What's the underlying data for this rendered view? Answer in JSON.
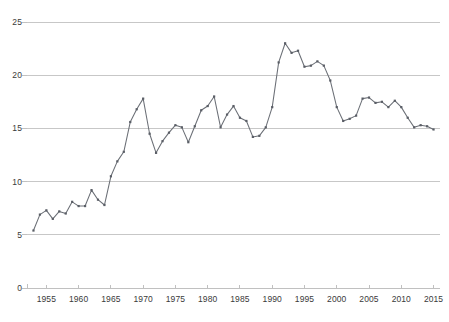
{
  "chart_data": {
    "type": "line",
    "title": "",
    "subtitle": "",
    "xlabel": "",
    "ylabel": "",
    "xlim": [
      1952,
      2016
    ],
    "ylim": [
      0,
      25
    ],
    "grid": true,
    "legend": false,
    "legend_position": "none",
    "line_color": "#6b6f76",
    "marker_color": "#5a5e66",
    "grid_color": "#b9b9b9",
    "axis_color": "#b9b9b9",
    "text_color": "#3a3a3a",
    "y_ticks": [
      0,
      5,
      10,
      15,
      20,
      25
    ],
    "y_tick_labels": [
      "0",
      "5",
      "10",
      "15",
      "20",
      "25"
    ],
    "x_ticks": [
      1955,
      1960,
      1965,
      1970,
      1975,
      1980,
      1985,
      1990,
      1995,
      2000,
      2005,
      2010,
      2015
    ],
    "x_tick_labels": [
      "1955",
      "1960",
      "1965",
      "1970",
      "1975",
      "1980",
      "1985",
      "1990",
      "1995",
      "2000",
      "2005",
      "2010",
      "2015"
    ],
    "x": [
      1953,
      1954,
      1955,
      1956,
      1957,
      1958,
      1959,
      1960,
      1961,
      1962,
      1963,
      1964,
      1965,
      1966,
      1967,
      1968,
      1969,
      1970,
      1971,
      1972,
      1973,
      1974,
      1975,
      1976,
      1977,
      1978,
      1979,
      1980,
      1981,
      1982,
      1983,
      1984,
      1985,
      1986,
      1987,
      1988,
      1989,
      1990,
      1991,
      1992,
      1993,
      1994,
      1995,
      1996,
      1997,
      1998,
      1999,
      2000,
      2001,
      2002,
      2003,
      2004,
      2005,
      2006,
      2007,
      2008,
      2009,
      2010,
      2011,
      2012,
      2013,
      2014,
      2015
    ],
    "values": [
      5.4,
      6.9,
      7.3,
      6.5,
      7.2,
      7.0,
      8.1,
      7.7,
      7.7,
      9.2,
      8.3,
      7.8,
      10.5,
      11.9,
      12.8,
      15.6,
      16.8,
      17.8,
      14.5,
      12.7,
      13.8,
      14.6,
      15.3,
      15.1,
      13.7,
      15.2,
      16.7,
      17.1,
      18.0,
      15.1,
      16.3,
      17.1,
      16.0,
      15.7,
      14.2,
      14.3,
      15.1,
      17.0,
      21.2,
      23.0,
      22.1,
      22.3,
      20.8,
      20.9,
      21.3,
      20.9,
      19.5,
      17.0,
      15.7,
      15.9,
      16.2,
      17.8,
      17.9,
      17.4,
      17.5,
      17.0,
      17.6,
      17.0,
      16.0,
      15.1,
      15.3,
      15.2,
      14.9
    ],
    "series": [
      {
        "name": "series-1",
        "values": [
          5.4,
          6.9,
          7.3,
          6.5,
          7.2,
          7.0,
          8.1,
          7.7,
          7.7,
          9.2,
          8.3,
          7.8,
          10.5,
          11.9,
          12.8,
          15.6,
          16.8,
          17.8,
          14.5,
          12.7,
          13.8,
          14.6,
          15.3,
          15.1,
          13.7,
          15.2,
          16.7,
          17.1,
          18.0,
          15.1,
          16.3,
          17.1,
          16.0,
          15.7,
          14.2,
          14.3,
          15.1,
          17.0,
          21.2,
          23.0,
          22.1,
          22.3,
          20.8,
          20.9,
          21.3,
          20.9,
          19.5,
          17.0,
          15.7,
          15.9,
          16.2,
          17.8,
          17.9,
          17.4,
          17.5,
          17.0,
          17.6,
          17.0,
          16.0,
          15.1,
          15.3,
          15.2,
          14.9
        ]
      }
    ],
    "annotations": []
  },
  "caption": ""
}
